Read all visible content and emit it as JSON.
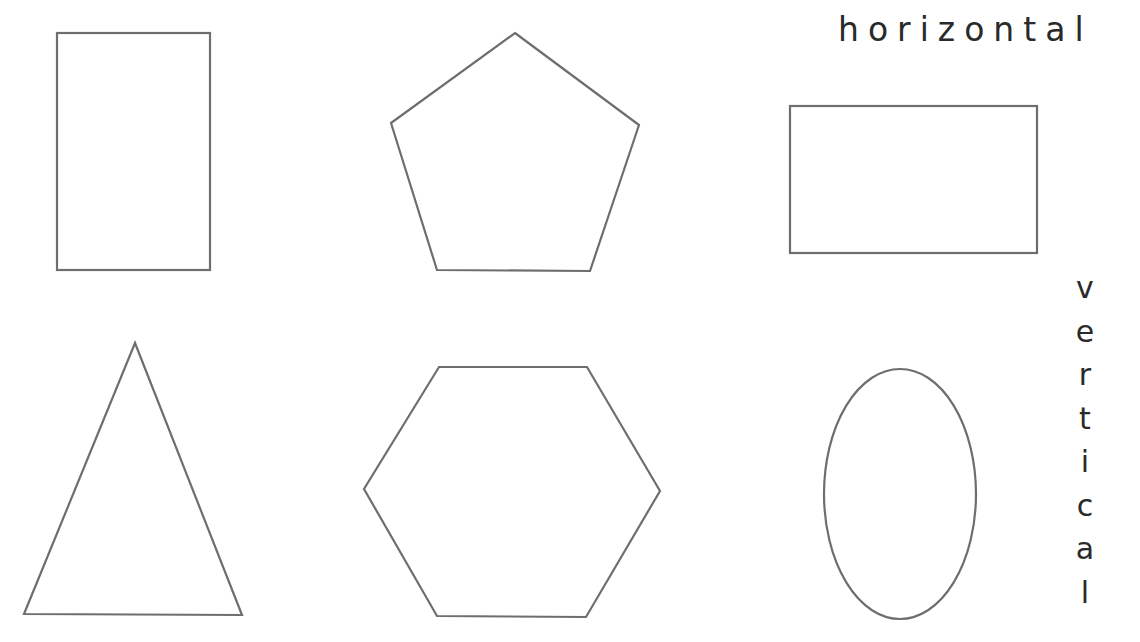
{
  "labels": {
    "horizontal": "horizontal",
    "vertical": [
      "v",
      "e",
      "r",
      "t",
      "i",
      "c",
      "a",
      "l"
    ]
  },
  "shapes": [
    {
      "name": "rectangle-vertical",
      "type": "rect",
      "x": 57,
      "y": 33,
      "width": 153,
      "height": 237
    },
    {
      "name": "pentagon",
      "type": "polygon",
      "points": "515,33 639,125 590,271 437,270 391,123"
    },
    {
      "name": "rectangle-horizontal",
      "type": "rect",
      "x": 790,
      "y": 106,
      "width": 247,
      "height": 147
    },
    {
      "name": "triangle",
      "type": "polygon",
      "points": "135,343 242,615 24,614"
    },
    {
      "name": "hexagon",
      "type": "polygon",
      "points": "439,367 587,367 660,491 586,617 437,616 364,489"
    },
    {
      "name": "ellipse-vertical",
      "type": "ellipse",
      "cx": 900,
      "cy": 494,
      "rx": 76,
      "ry": 125
    }
  ],
  "colors": {
    "stroke": "#6e6e6e",
    "text": "#2a2a2a",
    "background": "#ffffff"
  }
}
